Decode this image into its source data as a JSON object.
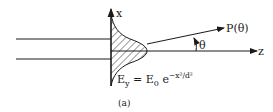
{
  "figure": {
    "caption": "(a)",
    "axes": {
      "x_label": "x",
      "z_label": "z"
    },
    "ray_label": "P(θ)",
    "angle_label": "θ",
    "equation": {
      "lhs": "E",
      "lhs_sub": "y",
      "eq": " = E",
      "rhs_sub": "0",
      "base": " e",
      "exponent": "−x²/d²"
    },
    "colors": {
      "ink": "#1a1a1a",
      "background": "#ffffff"
    }
  }
}
